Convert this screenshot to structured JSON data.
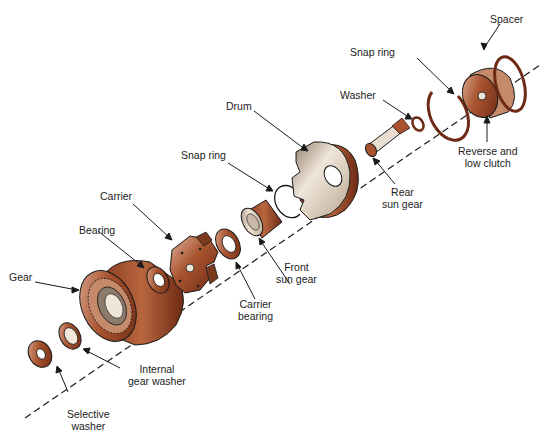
{
  "colors": {
    "copper_dark": "#6e2a14",
    "copper_mid": "#a8532e",
    "copper_light": "#d9a58a",
    "metal_light": "#e8ddd0",
    "metal_mid": "#b9a58f",
    "outline": "#1a1a1a",
    "label_text": "#222222"
  },
  "labels": {
    "spacer": [
      "Spacer"
    ],
    "snap_ring_rear": [
      "Snap ring"
    ],
    "washer": [
      "Washer"
    ],
    "reverse_low_clutch": [
      "Reverse and",
      "low clutch"
    ],
    "drum": [
      "Drum"
    ],
    "rear_sun_gear": [
      "Rear",
      "sun gear"
    ],
    "snap_ring_front": [
      "Snap ring"
    ],
    "carrier": [
      "Carrier"
    ],
    "bearing": [
      "Bearing"
    ],
    "front_sun_gear": [
      "Front",
      "sun gear"
    ],
    "carrier_bearing": [
      "Carrier",
      "bearing"
    ],
    "gear": [
      "Gear"
    ],
    "internal_gear_washer": [
      "Internal",
      "gear washer"
    ],
    "selective_washer": [
      "Selective",
      "washer"
    ]
  }
}
